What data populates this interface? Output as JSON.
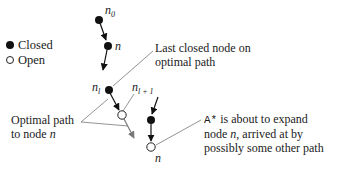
{
  "legend": {
    "closed_label": "Closed",
    "open_label": "Open"
  },
  "nodes": {
    "n0": {
      "label": "n",
      "sub": "0",
      "state": "closed"
    },
    "n_upper": {
      "label": "n",
      "state": "closed"
    },
    "nl": {
      "label": "n",
      "sub": "l",
      "state": "closed"
    },
    "nl1": {
      "label": "n",
      "sub": "l + 1",
      "state": "open"
    },
    "n_right_closed": {
      "state": "closed"
    },
    "n_bottom": {
      "label": "n",
      "state": "open"
    }
  },
  "annotations": {
    "last_closed_line1": "Last closed node on",
    "last_closed_line2": "optimal path",
    "optimal_line1": "Optimal path",
    "optimal_line2_prefix": "to node ",
    "optimal_line2_var": "n",
    "astar_prefix": "A*",
    "astar_line1_rest": " is about to expand",
    "astar_line2_prefix": "node ",
    "astar_line2_var": "n",
    "astar_line2_rest": ", arrived at by",
    "astar_line3": "possibly some other path"
  }
}
